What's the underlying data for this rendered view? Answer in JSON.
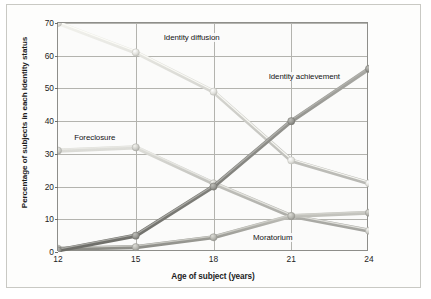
{
  "chart_data": {
    "type": "line",
    "title": "",
    "xlabel": "Age of subject (years)",
    "ylabel": "Percentage of subjects in each identity status",
    "x": [
      12,
      15,
      18,
      21,
      24
    ],
    "xticklabels": [
      "12",
      "15",
      "18",
      "21",
      "24"
    ],
    "yticklabels": [
      "0",
      "10",
      "20",
      "30",
      "40",
      "50",
      "60",
      "70"
    ],
    "yticks": [
      0,
      10,
      20,
      30,
      40,
      50,
      60,
      70
    ],
    "xlim": [
      12,
      24
    ],
    "ylim": [
      0,
      70
    ],
    "grid": true,
    "legend_position": "inline-labels",
    "markers": "circle",
    "series": [
      {
        "name": "Identity diffusion",
        "color": "#d4d4cf",
        "values": [
          70,
          61,
          49,
          28,
          21
        ],
        "label_x": 16.0,
        "label_y": 65.5
      },
      {
        "name": "Foreclosure",
        "color": "#c0c0bb",
        "values": [
          31,
          32,
          21,
          11,
          6.5
        ],
        "label_x": 12.55,
        "label_y": 35.0
      },
      {
        "name": "Moratorium",
        "color": "#a8a8a2",
        "values": [
          1,
          1.5,
          4.5,
          11,
          12
        ],
        "label_x": 19.45,
        "label_y": 4.3
      },
      {
        "name": "Identity achievement",
        "color": "#8a8a85",
        "values": [
          0.5,
          5,
          20,
          40,
          56
        ],
        "label_x": 20.05,
        "label_y": 53.5
      }
    ]
  }
}
